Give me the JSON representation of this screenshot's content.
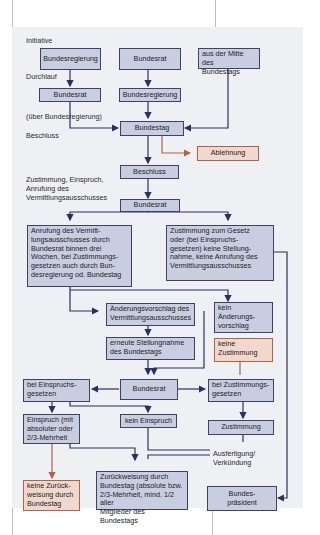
{
  "diagram": {
    "colors": {
      "panel": "#eef0f3",
      "box_fill": "#c9cde0",
      "box_border": "#3d4166",
      "reject_fill": "#f1d8cc",
      "reject_border": "#b0624a",
      "arrow": "#2c2f63",
      "reject_arrow": "#b0624a"
    },
    "labels": {
      "initiative": "Initiative",
      "durchlauf": "Durchlauf",
      "ueber_bundesregierung": "(über Bundesregierung)",
      "beschluss": "Beschluss",
      "zustimmung_einspruch": "Zustimmung, Einspruch,\nAnrufung des\nVermittlungsausschusses",
      "ausfertigung": "Ausfertigung/\nVerkündung"
    },
    "boxes": {
      "bundesregierung_init": "Bundesregierung",
      "bundesrat_init": "Bundesrat",
      "mitte_bundestag": "aus der Mitte des\nBundestags",
      "bundesrat_durchlauf": "Bundesrat",
      "bundesregierung_durchlauf": "Bundesregierung",
      "bundestag": "Bundestag",
      "ablehnung": "Ablehnung",
      "beschluss": "Beschluss",
      "bundesrat_1": "Bundesrat",
      "anrufung": "Anrufung des Vermitt-\nlungsausschusses durch\nBundesrat binnen drei\nWochen, bei Zustimmungs-\ngesetzen auch durch Bun-\ndesregierung od. Bundestag",
      "zustimmung_gesetz": "Zustimmung zum Gesetz\noder (bei Einspruchs-\ngesetzen) keine Stellung-\nnahme, keine Anrufung des\nVermittlungsausschusses",
      "aenderungsvorschlag": "Änderungsvorschlag des\nVermittlungsausschusses",
      "kein_aenderungsvorschlag": "kein\nÄnderungs-\nvorschlag",
      "erneute_stellungnahme": "erneute Stellungnahme\ndes Bundestags",
      "keine_zustimmung": "keine\nZustimmung",
      "bei_einspruchsgesetzen": "bei Einspruchs-\ngesetzen",
      "bundesrat_2": "Bundesrat",
      "bei_zustimmungsgesetzen": "bei Zustimmungs-\ngesetzen",
      "einspruch": "Einspruch (mit\nabsoluter oder\n2/3-Mehrheit",
      "kein_einspruch": "kein Einspruch",
      "zustimmung": "Zustimmung",
      "keine_zurueckweisung": "keine Zurück-\nweisung durch\nBundestag",
      "zurueckweisung": "Zurückweisung durch\nBundestag (absolute bzw.\n2/3-Mehrheit, mind. 1/2 aller\nMitglieder des Bundestags",
      "bundespraesident": "Bundes-\npräsident"
    }
  }
}
